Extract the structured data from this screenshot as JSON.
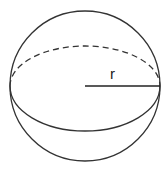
{
  "diagram": {
    "type": "sphere",
    "radius_label": "r",
    "stroke_color": "#333333",
    "background": "#ffffff"
  }
}
